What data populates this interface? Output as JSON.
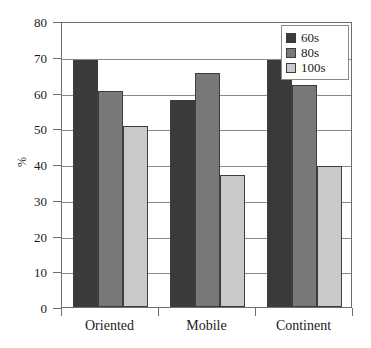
{
  "chart_data": {
    "type": "bar",
    "title": "",
    "subtitle": "",
    "xlabel": "",
    "ylabel": "%",
    "categories": [
      "Oriented",
      "Mobile",
      "Continent"
    ],
    "series": [
      {
        "name": "60s",
        "values": [
          69.0,
          58.0,
          69.0
        ],
        "color": "#3a3a3a"
      },
      {
        "name": "80s",
        "values": [
          60.5,
          65.5,
          62.0
        ],
        "color": "#787878"
      },
      {
        "name": "100s",
        "values": [
          50.5,
          37.0,
          39.5
        ],
        "color": "#c9c9c9"
      }
    ],
    "ylim": [
      0,
      80
    ],
    "yticks": [
      0,
      10,
      20,
      30,
      40,
      50,
      60,
      70,
      80
    ],
    "ytick_labels": [
      "0",
      "10",
      "20",
      "30",
      "40",
      "50",
      "60",
      "70",
      "80"
    ],
    "grid": true,
    "grid_axis": "y",
    "legend_position": "top-right",
    "legend_entries": [
      "60s",
      "80s",
      "100s"
    ],
    "bar_edge_color": "#3d3d3d",
    "axis_color": "#6e6e6e",
    "gridline_color": "#8a8a8a",
    "background_color": "#ffffff"
  }
}
